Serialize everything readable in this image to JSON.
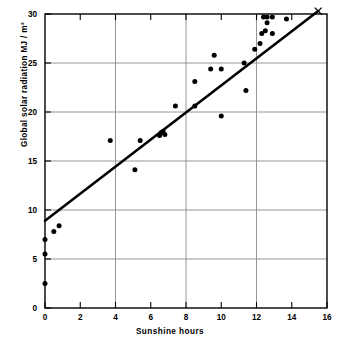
{
  "chart_data": {
    "type": "scatter",
    "title": "",
    "xlabel": "Sunshine hours",
    "ylabel": "Global solar radiation  MJ / m²",
    "xlim": [
      0,
      16
    ],
    "ylim": [
      0,
      30
    ],
    "xticks": [
      0,
      2,
      4,
      6,
      8,
      10,
      12,
      14,
      16
    ],
    "yticks": [
      0,
      5,
      10,
      15,
      20,
      25,
      30
    ],
    "xtick_labels": [
      "0",
      "2",
      "4",
      "6",
      "8",
      "10",
      "12",
      "14",
      "16"
    ],
    "ytick_labels": [
      "0",
      "5",
      "10",
      "15",
      "20",
      "25",
      "30"
    ],
    "grid": "major-horizontal-and-vertical",
    "legend": "none",
    "series": [
      {
        "name": "observations",
        "marker": "filled-circle",
        "color": "#000000",
        "points": [
          [
            0.0,
            7.0
          ],
          [
            0.0,
            5.5
          ],
          [
            0.0,
            2.5
          ],
          [
            0.5,
            7.8
          ],
          [
            0.8,
            8.4
          ],
          [
            3.7,
            17.1
          ],
          [
            5.1,
            14.1
          ],
          [
            5.4,
            17.1
          ],
          [
            6.5,
            17.6
          ],
          [
            6.6,
            17.9
          ],
          [
            6.7,
            18.0
          ],
          [
            6.8,
            17.7
          ],
          [
            7.4,
            20.6
          ],
          [
            8.5,
            23.1
          ],
          [
            8.5,
            20.6
          ],
          [
            9.4,
            24.4
          ],
          [
            9.6,
            25.8
          ],
          [
            10.0,
            24.4
          ],
          [
            10.0,
            19.6
          ],
          [
            11.3,
            25.0
          ],
          [
            11.4,
            22.2
          ],
          [
            11.9,
            26.4
          ],
          [
            12.2,
            27.0
          ],
          [
            12.3,
            28.0
          ],
          [
            12.4,
            29.7
          ],
          [
            12.5,
            28.3
          ],
          [
            12.6,
            29.1
          ],
          [
            12.6,
            29.7
          ],
          [
            12.9,
            28.0
          ],
          [
            12.9,
            29.7
          ],
          [
            13.7,
            29.5
          ]
        ]
      },
      {
        "name": "regression-line",
        "marker": "line",
        "color": "#000000",
        "line": {
          "x0": 0.0,
          "y0": 8.9,
          "x1": 15.5,
          "y1": 30.3
        }
      },
      {
        "name": "endpoint-cross",
        "marker": "x",
        "color": "#000000",
        "points": [
          [
            15.5,
            30.3
          ]
        ]
      }
    ]
  }
}
